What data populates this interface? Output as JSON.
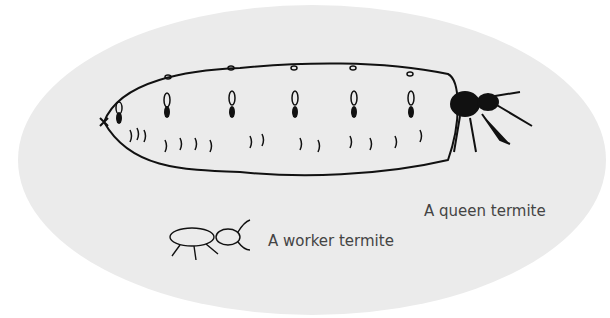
{
  "labels": {
    "queen": "A queen termite",
    "worker": "A worker termite"
  },
  "colors": {
    "oval": "#ebebeb",
    "ink": "#111111",
    "text": "#444444"
  }
}
